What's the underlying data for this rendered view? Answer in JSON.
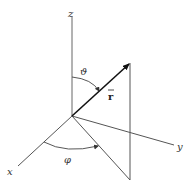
{
  "diagram": {
    "colors": {
      "line": "#555555",
      "vector": "#111111",
      "label": "#333333",
      "background": "#ffffff"
    },
    "axes": {
      "z": {
        "label": "z"
      },
      "x": {
        "label": "x"
      },
      "y": {
        "label": "y"
      }
    },
    "vector": {
      "label": "r⃗",
      "display": "r",
      "arrow": "→"
    },
    "angles": {
      "polar": {
        "label": "ϑ"
      },
      "azimuth": {
        "label": "φ"
      }
    }
  }
}
